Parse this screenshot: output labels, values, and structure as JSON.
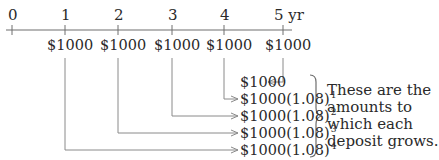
{
  "timeline": {
    "labels": [
      "0",
      "1",
      "2",
      "3",
      "4",
      "5 yr"
    ],
    "deposits": [
      "$1000",
      "$1000",
      "$1000",
      "$1000",
      "$1000"
    ]
  },
  "results": [
    {
      "base": "$1000",
      "exp": ""
    },
    {
      "base": "$1000(1.08)",
      "exp": "1"
    },
    {
      "base": "$1000(1.08)",
      "exp": "2"
    },
    {
      "base": "$1000(1.08)",
      "exp": "3"
    },
    {
      "base": "$1000(1.08)",
      "exp": "4"
    }
  ],
  "note": {
    "lines": [
      "These are the",
      "amounts to",
      "which each",
      "deposit grows."
    ]
  },
  "colors": {
    "text": "#2a2a2a",
    "line": "#6e6e6e",
    "arrow": "#8a8a8a"
  }
}
